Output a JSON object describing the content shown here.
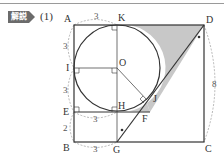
{
  "header": {
    "badge_label": "解説",
    "question_number": "(1)"
  },
  "diagram": {
    "points": {
      "A": "A",
      "K": "K",
      "D": "D",
      "I": "I",
      "O": "O",
      "E": "E",
      "H": "H",
      "J": "J",
      "F": "F",
      "B": "B",
      "G": "G",
      "C": "C"
    },
    "dimensions": {
      "AK": "3",
      "AI": "3",
      "IE": "3",
      "EB": "2",
      "EH": "3",
      "BG": "3",
      "DC": "8"
    },
    "colors": {
      "stroke": "#333333",
      "shade": "#c8c8c8",
      "dashed": "#9a9a9a"
    }
  }
}
